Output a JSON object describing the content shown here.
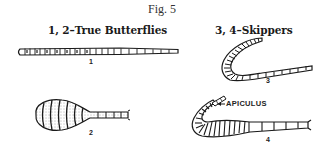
{
  "figure": {
    "title": "Fig. 5",
    "groups": [
      {
        "label": "1, 2–True Butterflies",
        "figures": [
          "1",
          "2"
        ]
      },
      {
        "label": "3, 4–Skippers",
        "figures": [
          "3",
          "4"
        ]
      }
    ],
    "drawings": [
      {
        "number": "1",
        "subject": "slender club antenna",
        "group": "True Butterflies"
      },
      {
        "number": "2",
        "subject": "knobbed club antenna",
        "group": "True Butterflies"
      },
      {
        "number": "3",
        "subject": "hooked club antenna",
        "group": "Skippers"
      },
      {
        "number": "4",
        "subject": "club antenna with apiculus",
        "group": "Skippers",
        "callout": "APICULUS"
      }
    ],
    "colors": {
      "ink": "#1a1a1a",
      "paper": "#ffffff"
    }
  }
}
